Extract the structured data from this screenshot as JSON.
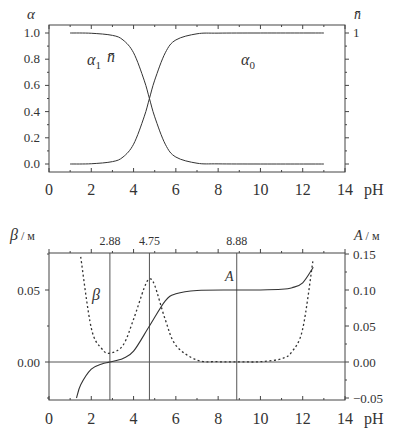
{
  "chart_data": [
    {
      "type": "line",
      "title": "",
      "xlabel": "pH",
      "ylabel_left": "α",
      "ylabel_right": "n̄",
      "xlim": [
        0,
        14
      ],
      "ylim": [
        0.0,
        1.0
      ],
      "x_ticks": [
        "0",
        "2",
        "4",
        "6",
        "8",
        "10",
        "12",
        "14"
      ],
      "y_ticks_left": [
        "0.0",
        "0.2",
        "0.4",
        "0.6",
        "0.8",
        "1.0"
      ],
      "y_ticks_right": [
        "1"
      ],
      "grid": false,
      "annotations": [
        {
          "text": "α₁",
          "x": 2.5,
          "y": 0.8
        },
        {
          "text": "n̄",
          "x": 3.3,
          "y": 0.8
        },
        {
          "text": "α₀",
          "x": 9.3,
          "y": 0.8
        }
      ],
      "series": [
        {
          "name": "α1 (n̄)",
          "style": "solid",
          "x": [
            1,
            2,
            3,
            3.5,
            4,
            4.5,
            4.75,
            5,
            5.5,
            6,
            7,
            8,
            10,
            13
          ],
          "y": [
            1.0,
            0.998,
            0.982,
            0.947,
            0.849,
            0.64,
            0.5,
            0.36,
            0.151,
            0.053,
            0.006,
            0.001,
            0.0,
            0.0
          ]
        },
        {
          "name": "α0",
          "style": "solid",
          "x": [
            1,
            2,
            3,
            3.5,
            4,
            4.5,
            4.75,
            5,
            5.5,
            6,
            7,
            8,
            10,
            13
          ],
          "y": [
            0.0,
            0.002,
            0.018,
            0.053,
            0.151,
            0.36,
            0.5,
            0.64,
            0.849,
            0.947,
            0.994,
            0.999,
            1.0,
            1.0
          ]
        }
      ]
    },
    {
      "type": "line",
      "title": "",
      "xlabel": "pH",
      "ylabel_left": "β / м",
      "ylabel_right": "A / м",
      "xlim": [
        0,
        14
      ],
      "ylim_left": [
        -0.025,
        0.075
      ],
      "ylim_right": [
        -0.05,
        0.15
      ],
      "x_ticks": [
        "0",
        "2",
        "4",
        "6",
        "8",
        "10",
        "12",
        "14"
      ],
      "y_ticks_left": [
        "0.00",
        "0.05"
      ],
      "y_ticks_right": [
        "-0.05",
        "0.00",
        "0.05",
        "0.10",
        "0.15"
      ],
      "top_markers": [
        "2.88",
        "4.75",
        "8.88"
      ],
      "vertical_lines_at": [
        2.88,
        4.75,
        8.88
      ],
      "horizontal_line_at": 0.0,
      "grid": false,
      "annotations": [
        {
          "text": "β",
          "x": 2.0,
          "y_left": 0.046
        },
        {
          "text": "A",
          "x": 8.3,
          "y_right": 0.117
        }
      ],
      "series": [
        {
          "name": "β",
          "style": "dotted",
          "axis": "left",
          "x": [
            1.5,
            2.0,
            2.5,
            2.88,
            3.5,
            4.0,
            4.5,
            4.75,
            5.0,
            5.5,
            6.0,
            7.0,
            8.0,
            9.0,
            10.0,
            11.0,
            11.5,
            12.0,
            12.48
          ],
          "y": [
            0.073,
            0.0235,
            0.0092,
            0.0061,
            0.0116,
            0.0297,
            0.0513,
            0.0576,
            0.0532,
            0.0294,
            0.0116,
            0.0013,
            0.0002,
            0.0001,
            0.0002,
            0.0023,
            0.0073,
            0.023,
            0.07
          ]
        },
        {
          "name": "A",
          "style": "solid",
          "axis": "right",
          "x": [
            1.3,
            1.5,
            2.0,
            2.5,
            2.88,
            3.5,
            4.0,
            4.75,
            5.5,
            6.0,
            7.0,
            8.88,
            10.0,
            11.0,
            11.5,
            12.0,
            12.5
          ],
          "y": [
            -0.05,
            -0.0316,
            -0.0099,
            -0.0027,
            0.0,
            0.005,
            0.015,
            0.05,
            0.085,
            0.0947,
            0.0994,
            0.1,
            0.1001,
            0.101,
            0.1032,
            0.11,
            0.1316
          ]
        }
      ]
    }
  ],
  "labels": {
    "top_alpha": "α",
    "top_nbar": "n̄",
    "top_alpha1": "α",
    "top_alpha1_sub": "1",
    "top_nbar_inline": "n̄",
    "top_alpha0": "α",
    "top_alpha0_sub": "0",
    "top_right_tick": "1",
    "ph": "pH",
    "beta_axis": "β",
    "beta_unit": " / м",
    "a_axis": "A",
    "a_unit": " / м",
    "beta_curve": "β",
    "a_curve": "A"
  }
}
